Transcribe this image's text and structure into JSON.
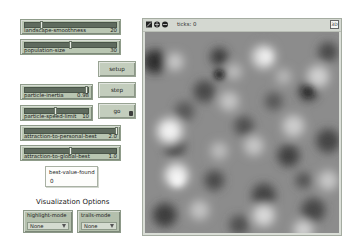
{
  "sliders": [
    {
      "id": "landscape-smoothness",
      "label": "landscape-smoothness",
      "value": "20",
      "fraction": 0.2
    },
    {
      "id": "population-size",
      "label": "population-size",
      "value": "30",
      "fraction": 0.49
    },
    {
      "id": "particle-inertia",
      "label": "particle-inertia",
      "value": "0.98",
      "fraction": 0.98
    },
    {
      "id": "particle-speed-limit",
      "label": "particle-speed-limit",
      "value": "10",
      "fraction": 0.48
    },
    {
      "id": "attraction-to-personal-best",
      "label": "attraction-to-personal-best",
      "value": "2.0",
      "fraction": 1.0
    },
    {
      "id": "attraction-to-global-best",
      "label": "attraction-to-global-best",
      "value": "1.0",
      "fraction": 0.5
    }
  ],
  "buttons": {
    "setup": "setup",
    "step": "step",
    "go": "go"
  },
  "monitor": {
    "label": "best-value-found",
    "value": "0"
  },
  "visualization": {
    "title": "Visualization Options",
    "highlight_mode": {
      "label": "highlight-mode",
      "value": "None"
    },
    "trails_mode": {
      "label": "trails-mode",
      "value": "None"
    }
  },
  "view": {
    "ticks_label": "ticks: 0",
    "three_d_label": "3D",
    "toolbar_icons": [
      "follow-icon",
      "horizontal-wrap-icon",
      "vertical-wrap-icon"
    ]
  },
  "colors": {
    "widget_bg": "#b9c6b2",
    "button_bg": "#c3cdbd",
    "slider_track": "#5f6b5e",
    "landscape_dark": "#2b2b2b",
    "landscape_light": "#f2f2f2"
  }
}
